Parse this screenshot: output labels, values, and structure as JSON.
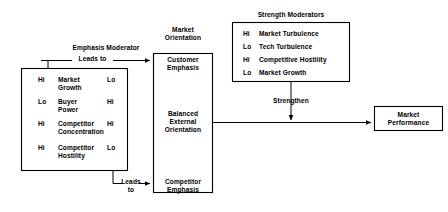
{
  "diagram": {
    "colors": {
      "line": "#000000",
      "text": "#000000",
      "background": "#ffffff"
    }
  },
  "emphasis_moderator": {
    "caption": "Emphasis Moderator",
    "edge_label_top": "Leads to",
    "edge_label_bottom": "Leads\nto",
    "rows": [
      {
        "left": "Hi",
        "factor": "Market\nGrowth",
        "right": "Lo"
      },
      {
        "left": "Lo",
        "factor": "Buyer\nPower",
        "right": "Hi"
      },
      {
        "left": "Hi",
        "factor": "Competitor\nConcentration",
        "right": "Hi"
      },
      {
        "left": "Hi",
        "factor": "Competitor\nHostility",
        "right": "Lo"
      }
    ]
  },
  "market_orientation": {
    "caption": "Market\nOrientation",
    "segments": [
      {
        "label": "Customer\nEmphasis"
      },
      {
        "label": "Balanced\nExternal\nOrientation"
      },
      {
        "label": "Competitor\nEmphasis"
      }
    ]
  },
  "strength_moderators": {
    "caption": "Strength Moderators",
    "items": [
      {
        "level": "Hi",
        "factor": "Market Turbulence"
      },
      {
        "level": "Lo",
        "factor": "Tech Turbulence"
      },
      {
        "level": "Hi",
        "factor": "Competitive Hostility"
      },
      {
        "level": "Lo",
        "factor": "Market Growth"
      }
    ],
    "edge_label": "Strengthen"
  },
  "outcome": {
    "label": "Market\nPerformance"
  }
}
